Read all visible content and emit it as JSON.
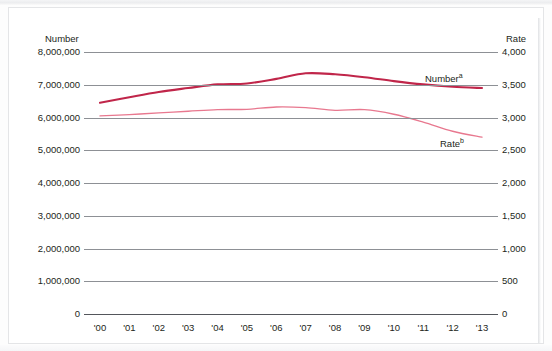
{
  "chart_data": {
    "type": "line",
    "title": "",
    "xlabel": "",
    "categories": [
      "'00",
      "'01",
      "'02",
      "'03",
      "'04",
      "'05",
      "'06",
      "'07",
      "'08",
      "'09",
      "'10",
      "'11",
      "'12",
      "'13"
    ],
    "grid": true,
    "legend_position": "inline-right",
    "axes": {
      "left": {
        "title": "Number",
        "ticks": [
          "0",
          "1,000,000",
          "2,000,000",
          "3,000,000",
          "4,000,000",
          "5,000,000",
          "6,000,000",
          "7,000,000",
          "8,000,000"
        ],
        "tick_values": [
          0,
          1000000,
          2000000,
          3000000,
          4000000,
          5000000,
          6000000,
          7000000,
          8000000
        ],
        "ylim": [
          0,
          8000000
        ]
      },
      "right": {
        "title": "Rate",
        "ticks": [
          "0",
          "500",
          "1,000",
          "1,500",
          "2,000",
          "2,500",
          "3,000",
          "3,500",
          "4,000"
        ],
        "tick_values": [
          0,
          500,
          1000,
          1500,
          2000,
          2500,
          3000,
          3500,
          4000
        ],
        "ylim": [
          0,
          4000
        ]
      }
    },
    "series": [
      {
        "name": "Number",
        "footnote": "a",
        "label_text": "Number",
        "axis": "left",
        "color": "#c0264a",
        "width": 2.1,
        "values": [
          6450000,
          6620000,
          6780000,
          6900000,
          7010000,
          7040000,
          7180000,
          7350000,
          7320000,
          7230000,
          7110000,
          7010000,
          6940000,
          6900000
        ]
      },
      {
        "name": "Rate",
        "footnote": "b",
        "label_text": "Rate",
        "axis": "right",
        "color": "#e8788f",
        "width": 1.35,
        "values": [
          3025,
          3045,
          3070,
          3095,
          3120,
          3125,
          3160,
          3150,
          3110,
          3120,
          3050,
          2930,
          2790,
          2700
        ]
      }
    ]
  }
}
